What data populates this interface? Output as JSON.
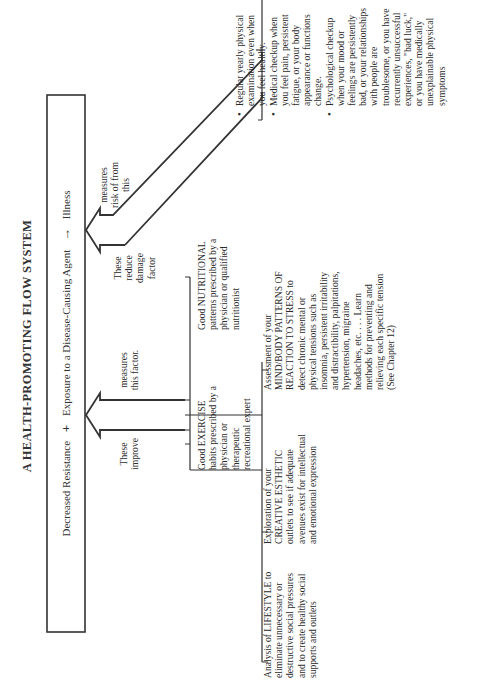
{
  "title": "A HEALTH-PROMOTING FLOW SYSTEM",
  "equation": {
    "term1": "Decreased Resistance",
    "operator": "+",
    "term2": "Exposure to a Disease-Causing Agent",
    "arrow": "→",
    "result": "Illness"
  },
  "left_arrow": {
    "label_left": "These improve",
    "label_right": "measures this factor."
  },
  "right_arrow": {
    "label_left": "These reduce damage factor",
    "label_right": "measures risk of from this"
  },
  "improve_items": [
    {
      "name": "exercise",
      "text": "Good EXERCISE habits prescribed by a physician or therapeutic recreational expert"
    },
    {
      "name": "nutrition",
      "text": "Good NUTRITIONAL patterns prescribed by a physician or qualified nutritionist"
    }
  ],
  "lower_items": [
    {
      "name": "lifestyle",
      "text": "Analysis of LIFESTYLE to eliminate unnecessary or destructive social pressures and to create healthy social supports and outlets"
    },
    {
      "name": "creative",
      "text": "Exploration of your CREATIVE ESTHETIC outlets to see if adequate avenues exist for intellectual and emotional expression"
    },
    {
      "name": "mindbody",
      "text": "Assessment of your MIND/BODY PATTERNS OF REACTION TO STRESS to detect chronic mental or physical tensions such as insomnia, persistent irritability and distractibility, palpitations, hypertension, migraine headaches, etc. . . . Learn methods for preventing and relieving each specific tension (See Chapter 12)"
    }
  ],
  "checkups": [
    "Regular yearly physical examination even when you feel healthy.",
    "Medical checkup when you feel pain, persistent fatigue, or your body appearance or functions change.",
    "Psychological checkup when your mood or feelings are persistently bad, or your relationships with people are troublesome, or you have recurrently unsuccessful experiences, \"bad luck,\" or you have medically unexplainable physical symptoms"
  ]
}
